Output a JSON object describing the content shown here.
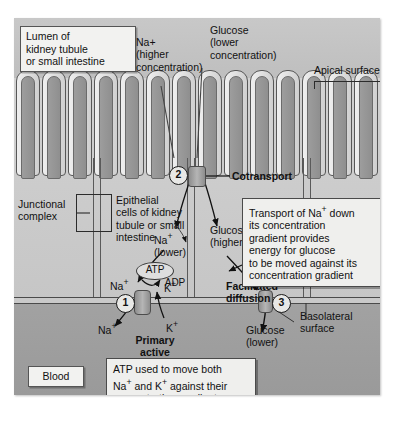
{
  "figure": {
    "regions": {
      "lumen_label": "Lumen of\nkidney tubule\nor small intestine",
      "blood_label": "Blood",
      "apical_label": "Apical surface",
      "basolateral_label": "Basolateral\nsurface",
      "junctional_label": "Junctional\ncomplex",
      "epithelial_label": "Epithelial\ncells of kidney\ntubule or small\nintestine"
    },
    "lumen_solutes": {
      "sodium": "Na+\n(higher\nconcentration)",
      "sodium_ion": "Na",
      "sodium_charge": "+",
      "glucose": "Glucose\n(lower\nconcentration)"
    },
    "cytoplasm_solutes": {
      "sodium_low": "Na",
      "sodium_low_charge": "+",
      "sodium_low_sub": "(lower)",
      "glucose_high": "Glucose\n(higher)"
    },
    "blood_solutes": {
      "glucose_low": "Glucose\n(lower)"
    },
    "steps": [
      {
        "number": "2",
        "name": "Cotransport",
        "label": "Cotransport"
      },
      {
        "number": "1",
        "name": "Primary active transport",
        "label": "Primary\nactive\ntransport"
      },
      {
        "number": "3",
        "name": "Facilitated diffusion",
        "label": "Facilitated\ndiffusion"
      }
    ],
    "pump_molecules": {
      "atp": "ATP",
      "adp": "ADP",
      "na_in": "Na",
      "na_in_charge": "+",
      "na_out": "Na",
      "na_out_charge": "+",
      "k_in": "K",
      "k_in_charge": "+",
      "k_out": "K",
      "k_out_charge": "+"
    },
    "callouts": [
      {
        "name": "cotransport-callout",
        "text": "Transport of Na+ down\nits concentration\ngradient provides\nenergy for glucose\nto be moved against its\nconcentration gradient",
        "line1_a": "Transport of Na",
        "line1_sup": "+",
        "line1_b": " down",
        "rest": "its concentration\ngradient provides\nenergy for glucose\nto be moved against its\nconcentration gradient"
      },
      {
        "name": "atp-callout",
        "text": "ATP used to move both\nNa+ and K+ against their\nconcentration gradients",
        "line1": "ATP used to move both",
        "line2_a": "Na",
        "line2_sup1": "+",
        "line2_b": " and K",
        "line2_sup2": "+",
        "line2_c": " against their",
        "line3": "concentration gradients"
      }
    ],
    "colors": {
      "lumen_bg": "#c8c8c8",
      "cytoplasm_bg": "#cdcdcd",
      "blood_bg": "#9e9e9e",
      "membrane": "#4a4a4a",
      "protein": "#8d8d8d",
      "text": "#111111",
      "callout_bg": "#efefed"
    }
  }
}
